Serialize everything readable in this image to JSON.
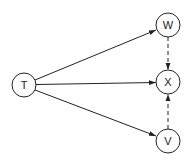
{
  "diagram": {
    "type": "directed-graph",
    "colors": {
      "stroke": "#222222",
      "background": "#ffffff"
    },
    "nodes": [
      {
        "id": "T",
        "label": "T",
        "cx": 24,
        "cy": 85,
        "r": 12
      },
      {
        "id": "W",
        "label": "W",
        "cx": 168,
        "cy": 25,
        "r": 12
      },
      {
        "id": "X",
        "label": "X",
        "cx": 168,
        "cy": 82,
        "r": 12
      },
      {
        "id": "V",
        "label": "V",
        "cx": 168,
        "cy": 141,
        "r": 12
      }
    ],
    "edges": [
      {
        "from": "T",
        "to": "W",
        "style": "solid"
      },
      {
        "from": "T",
        "to": "X",
        "style": "solid"
      },
      {
        "from": "T",
        "to": "V",
        "style": "solid"
      },
      {
        "from": "W",
        "to": "X",
        "style": "dashed"
      },
      {
        "from": "V",
        "to": "X",
        "style": "dashed"
      }
    ]
  }
}
